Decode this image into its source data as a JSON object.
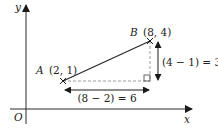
{
  "axes": {
    "x_label": "x",
    "y_label": "y",
    "origin_label": "O"
  },
  "points": {
    "A": {
      "name": "A",
      "coords": "(2, 1)"
    },
    "B": {
      "name": "B",
      "coords": "(8, 4)"
    }
  },
  "annotations": {
    "horizontal": "(8 − 2) = 6",
    "vertical": "(4 − 1) = 3"
  },
  "colors": {
    "line": "#2a2a2a",
    "dashed": "#9a9a9a",
    "text": "#222222"
  }
}
